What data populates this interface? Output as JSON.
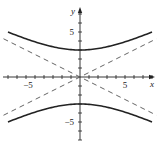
{
  "chart_data": {
    "type": "line",
    "title": "",
    "xlabel": "x",
    "ylabel": "y",
    "xlim": [
      -8.5,
      8.5
    ],
    "ylim": [
      -7.5,
      8
    ],
    "grid": false,
    "x_ticks": [
      -8,
      -7,
      -6,
      -5,
      -4,
      -3,
      -2,
      -1,
      1,
      2,
      3,
      4,
      5,
      6,
      7,
      8
    ],
    "y_ticks": [
      -7,
      -6,
      -5,
      -4,
      -3,
      -2,
      -1,
      1,
      2,
      3,
      4,
      5,
      6,
      7
    ],
    "x_tick_labels": [
      {
        "value": -5,
        "label": "−5"
      },
      {
        "value": 5,
        "label": "5"
      }
    ],
    "y_tick_labels": [
      {
        "value": 5,
        "label": "5"
      },
      {
        "value": -5,
        "label": "−5"
      }
    ],
    "series": [
      {
        "name": "hyperbola upper branch",
        "style": "solid",
        "x": [
          -8,
          -6,
          -4,
          -2,
          0,
          2,
          4,
          6,
          8
        ],
        "y": [
          5.0,
          4.24,
          3.61,
          3.16,
          3.0,
          3.16,
          3.61,
          4.24,
          5.0
        ]
      },
      {
        "name": "hyperbola lower branch",
        "style": "solid",
        "x": [
          -8,
          -6,
          -4,
          -2,
          0,
          2,
          4,
          6,
          8
        ],
        "y": [
          -5.0,
          -4.24,
          -3.61,
          -3.16,
          -3.0,
          -3.16,
          -3.61,
          -4.24,
          -5.0
        ]
      },
      {
        "name": "asymptote y = x/2",
        "style": "dashed",
        "x": [
          -8.5,
          8.5
        ],
        "y": [
          -4.25,
          4.25
        ]
      },
      {
        "name": "asymptote y = -x/2",
        "style": "dashed",
        "x": [
          -8.5,
          8.5
        ],
        "y": [
          4.25,
          -4.25
        ]
      }
    ],
    "annotations": []
  },
  "labels": {
    "x_axis": "x",
    "y_axis": "y",
    "x_neg5": "−5",
    "x_pos5": "5",
    "y_pos5": "5",
    "y_neg5": "−5"
  },
  "colors": {
    "curve": "#222222",
    "asymptote": "#555555",
    "axis": "#222222"
  }
}
